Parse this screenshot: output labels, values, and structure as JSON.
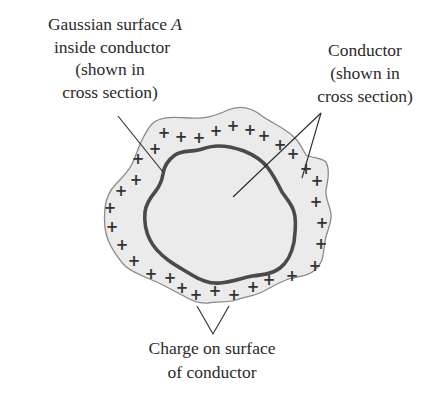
{
  "figure": {
    "labels": {
      "gaussian_surface": {
        "lines": [
          "Gaussian surface ",
          "inside conductor",
          "(shown in",
          "cross section)"
        ],
        "italic_symbol": "A"
      },
      "conductor": {
        "lines": [
          "Conductor",
          "(shown in",
          "cross section)"
        ]
      },
      "surface_charge": {
        "lines": [
          "Charge on surface",
          "of conductor"
        ]
      }
    },
    "charge_symbol": "+",
    "colors": {
      "conductor_fill": "#ebebeb",
      "conductor_outline": "#8a8a8a",
      "gaussian_surface_stroke": "#4a4a4a",
      "text": "#2a2a2a"
    }
  }
}
